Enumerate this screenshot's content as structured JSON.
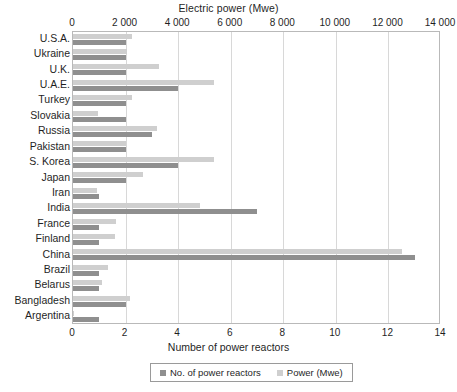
{
  "chart_data": {
    "type": "bar",
    "orientation": "horizontal",
    "title": "",
    "top_axis_label": "Electric power (Mwe)",
    "bottom_axis_label": "Number of power reactors",
    "ylabel": "",
    "grid": true,
    "legend_position": "bottom",
    "categories": [
      "U.S.A.",
      "Ukraine",
      "U.K.",
      "U.A.E.",
      "Turkey",
      "Slovakia",
      "Russia",
      "Pakistan",
      "S. Korea",
      "Japan",
      "Iran",
      "India",
      "France",
      "Finland",
      "China",
      "Brazil",
      "Belarus",
      "Bangladesh",
      "Argentina"
    ],
    "series": [
      {
        "name": "No. of power reactors",
        "color": "#8f8f8f",
        "axis": "bottom",
        "axis_label": "Number of power reactors",
        "xlim": [
          0,
          14
        ],
        "ticks": [
          "0",
          "2",
          "4",
          "6",
          "8",
          "10",
          "12",
          "14"
        ],
        "tick_values": [
          0,
          2,
          4,
          6,
          8,
          10,
          12,
          14
        ],
        "values": [
          2,
          2,
          2,
          4,
          2,
          2,
          3,
          2,
          4,
          2,
          1,
          7,
          1,
          1,
          13,
          1,
          1,
          2,
          1
        ]
      },
      {
        "name": "Power (Mwe)",
        "color": "#cfcfcf",
        "axis": "top",
        "axis_label": "Electric power (Mwe)",
        "xlim": [
          0,
          14000
        ],
        "ticks": [
          "0",
          "2 000",
          "4 000",
          "6 000",
          "8 000",
          "10 000",
          "12 000",
          "14 000"
        ],
        "tick_values": [
          0,
          2000,
          4000,
          6000,
          8000,
          10000,
          12000,
          14000
        ],
        "values": [
          2234,
          2070,
          3260,
          5380,
          2228,
          942,
          3200,
          2028,
          5360,
          2650,
          915,
          4824,
          1630,
          1600,
          12500,
          1340,
          1109,
          2160,
          25
        ]
      }
    ]
  },
  "legend": {
    "items": [
      {
        "label": "No. of power reactors",
        "color": "#8f8f8f"
      },
      {
        "label": "Power (Mwe)",
        "color": "#cfcfcf"
      }
    ]
  }
}
